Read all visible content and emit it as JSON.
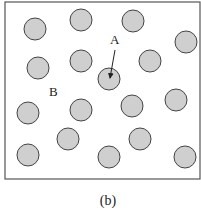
{
  "figure": {
    "caption": "(b)",
    "frame": {
      "x": 5,
      "y": 2,
      "width": 196,
      "height": 177,
      "stroke": "#555555"
    },
    "particle_fill": "#cfcfcf",
    "particle_stroke": "#444444",
    "particle_radius": 11,
    "particles": [
      {
        "cx": 35,
        "cy": 29
      },
      {
        "cx": 81,
        "cy": 20
      },
      {
        "cx": 133,
        "cy": 21
      },
      {
        "cx": 186,
        "cy": 42
      },
      {
        "cx": 38,
        "cy": 68
      },
      {
        "cx": 81,
        "cy": 61
      },
      {
        "cx": 150,
        "cy": 61
      },
      {
        "cx": 109,
        "cy": 79
      },
      {
        "cx": 28,
        "cy": 113
      },
      {
        "cx": 81,
        "cy": 110
      },
      {
        "cx": 132,
        "cy": 106
      },
      {
        "cx": 176,
        "cy": 100
      },
      {
        "cx": 68,
        "cy": 139
      },
      {
        "cx": 140,
        "cy": 139
      },
      {
        "cx": 28,
        "cy": 155
      },
      {
        "cx": 109,
        "cy": 157
      },
      {
        "cx": 185,
        "cy": 157
      }
    ],
    "labels": [
      {
        "text": "A",
        "x": 110,
        "y": 44
      },
      {
        "text": "B",
        "x": 49,
        "y": 96
      }
    ],
    "arrow": {
      "x1": 115,
      "y1": 50,
      "x2": 110,
      "y2": 78
    }
  }
}
